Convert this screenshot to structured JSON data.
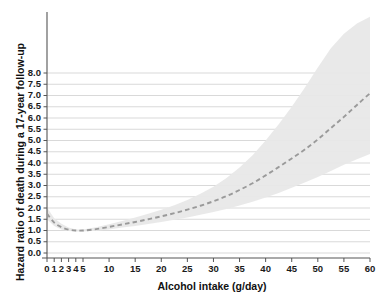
{
  "chart_data": {
    "type": "line",
    "title": "",
    "xlabel": "Alcohol intake (g/day)",
    "ylabel": "Hazard ratio of death during a 17-year follow-up",
    "xlim": [
      0,
      60
    ],
    "ylim": [
      0.0,
      8.0
    ],
    "grid": true,
    "legend": "none",
    "xticks": [
      0,
      1,
      2,
      3,
      4,
      5,
      10,
      15,
      20,
      25,
      30,
      35,
      40,
      45,
      50,
      55,
      60
    ],
    "xtick_labels": [
      "0",
      "1",
      "2",
      "3",
      "4",
      "5",
      "10",
      "15",
      "20",
      "25",
      "30",
      "35",
      "40",
      "45",
      "50",
      "55",
      "60"
    ],
    "yticks": [
      0.0,
      0.5,
      1.0,
      1.5,
      2.0,
      2.5,
      3.0,
      3.5,
      4.0,
      4.5,
      5.0,
      5.5,
      6.0,
      6.5,
      7.0,
      7.5,
      8.0
    ],
    "ytick_labels": [
      "0.0",
      "0.5",
      "1.0",
      "1.5",
      "2.0",
      "2.5",
      "3.0",
      "3.5",
      "4.0",
      "4.5",
      "5.0",
      "5.5",
      "6.0",
      "6.5",
      "7.0",
      "7.5",
      "8.0"
    ],
    "line_style": "dashed",
    "line_color": "#9a9a9a",
    "band_color": "#e8e8e8",
    "grid_color": "#c9c9c9",
    "axis_color": "#555555",
    "series": [
      {
        "name": "Hazard ratio",
        "x": [
          0,
          1,
          2,
          3,
          4,
          5,
          7.5,
          10,
          12.5,
          15,
          17.5,
          20,
          22.5,
          25,
          27.5,
          30,
          32.5,
          35,
          37.5,
          40,
          42.5,
          45,
          47.5,
          50,
          52.5,
          55,
          57.5,
          60
        ],
        "values": [
          1.75,
          1.35,
          1.15,
          1.04,
          1.0,
          1.0,
          1.06,
          1.16,
          1.27,
          1.38,
          1.5,
          1.63,
          1.77,
          1.93,
          2.1,
          2.3,
          2.53,
          2.8,
          3.1,
          3.45,
          3.82,
          4.2,
          4.6,
          5.05,
          5.55,
          6.05,
          6.58,
          7.1
        ]
      },
      {
        "name": "Upper 95% confidence limit",
        "x": [
          0,
          1,
          2,
          3,
          4,
          5,
          7.5,
          10,
          12.5,
          15,
          17.5,
          20,
          22.5,
          25,
          27.5,
          30,
          32.5,
          35,
          37.5,
          40,
          42.5,
          45,
          47.5,
          50,
          52.5,
          55,
          57.5,
          60
        ],
        "values": [
          2.02,
          1.55,
          1.3,
          1.13,
          1.05,
          1.04,
          1.14,
          1.28,
          1.42,
          1.58,
          1.74,
          1.92,
          2.12,
          2.36,
          2.63,
          2.95,
          3.33,
          3.8,
          4.35,
          5.0,
          5.72,
          6.5,
          7.35,
          8.25,
          9.1,
          9.75,
          10.2,
          10.5
        ]
      },
      {
        "name": "Lower 95% confidence limit",
        "x": [
          0,
          1,
          2,
          3,
          4,
          5,
          7.5,
          10,
          12.5,
          15,
          17.5,
          20,
          22.5,
          25,
          27.5,
          30,
          32.5,
          35,
          37.5,
          40,
          42.5,
          45,
          47.5,
          50,
          52.5,
          55,
          57.5,
          60
        ],
        "values": [
          1.5,
          1.2,
          1.04,
          0.98,
          0.96,
          0.96,
          0.99,
          1.05,
          1.13,
          1.2,
          1.29,
          1.38,
          1.48,
          1.58,
          1.7,
          1.82,
          1.96,
          2.11,
          2.28,
          2.47,
          2.67,
          2.9,
          3.13,
          3.38,
          3.65,
          3.92,
          4.17,
          4.4
        ]
      }
    ]
  }
}
